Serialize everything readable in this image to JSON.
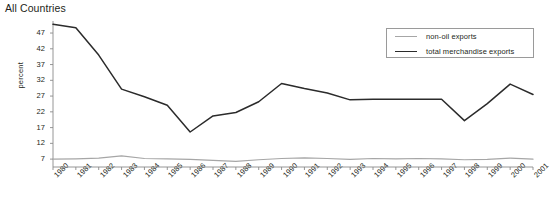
{
  "chart_data": {
    "type": "line",
    "title": "All Countries",
    "xlabel": "",
    "ylabel": "percent",
    "grid": false,
    "legend_position": "top-right",
    "ylim": [
      4.5,
      50.5
    ],
    "yticks": [
      7,
      12,
      17,
      22,
      27,
      32,
      37,
      42,
      47
    ],
    "categories": [
      "1980",
      "1981",
      "1982",
      "1983",
      "1984",
      "1985",
      "1986",
      "1987",
      "1988",
      "1989",
      "1990",
      "1991",
      "1992",
      "1993",
      "1994",
      "1995",
      "1996",
      "1997",
      "1998",
      "1999",
      "2000",
      "2001"
    ],
    "series": [
      {
        "name": "non-oil exports",
        "color": "#a6a6a6",
        "values": [
          7.0,
          7.1,
          7.3,
          8.0,
          7.2,
          7.1,
          6.9,
          6.6,
          6.3,
          6.8,
          7.2,
          7.4,
          7.2,
          6.9,
          7.2,
          7.1,
          7.2,
          7.1,
          6.8,
          6.9,
          7.3,
          7.0
        ]
      },
      {
        "name": "total merchandise exports",
        "color": "#2b2b2b",
        "values": [
          49.8,
          48.7,
          40.0,
          29.2,
          26.8,
          24.1,
          15.6,
          20.7,
          21.8,
          25.2,
          31.0,
          29.4,
          28.0,
          25.8,
          26.0,
          26.0,
          26.0,
          26.0,
          19.2,
          24.6,
          30.8,
          27.5
        ]
      }
    ]
  },
  "legend": {
    "items": [
      {
        "label": "non-oil exports",
        "color": "#a6a6a6"
      },
      {
        "label": "total merchandise exports",
        "color": "#2b2b2b"
      }
    ]
  }
}
